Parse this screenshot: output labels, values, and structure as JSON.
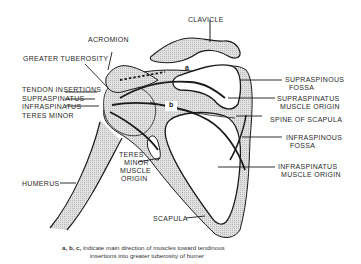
{
  "diagram": {
    "type": "anatomical-line-drawing",
    "fill_color": "#d4d4d4",
    "stroke_color": "#1a1a1a",
    "labels": {
      "clavicle": "CLAVICLE",
      "acromion": "ACROMION",
      "greater_tuberosity": "GREATER TUBEROSITY",
      "tendon_insertions": "TENDON INSERTIONS",
      "supraspinatus": "SUPRASPINATUS",
      "infraspinatus": "INFRASPINATUS",
      "teres_minor": "TERES MINOR",
      "supraspinous_fossa_1": "SUPRASPINOUS",
      "supraspinous_fossa_2": "FOSSA",
      "supraspinatus_origin_1": "SUPRASPINATUS",
      "supraspinatus_origin_2": "MUSCLE ORIGIN",
      "spine_of_scapula": "SPINE OF SCAPULA",
      "infraspinous_fossa_1": "INFRASPINOUS",
      "infraspinous_fossa_2": "FOSSA",
      "infraspinatus_origin_1": "INFRASPINATUS",
      "infraspinatus_origin_2": "MUSCLE ORIGIN",
      "teres_minor_origin_1": "TERES",
      "teres_minor_origin_2": "MINOR",
      "teres_minor_origin_3": "MUSCLE",
      "teres_minor_origin_4": "ORIGIN",
      "humerus": "HUMERUS",
      "scapula": "SCAPULA"
    },
    "direction_letters": {
      "a": "a",
      "b": "b"
    },
    "caption": {
      "prefix": "a, b, c,",
      "line1": " indicate main direction of muscles toward tendinous",
      "line2": "insertions into greater tuberosity of humer"
    }
  }
}
